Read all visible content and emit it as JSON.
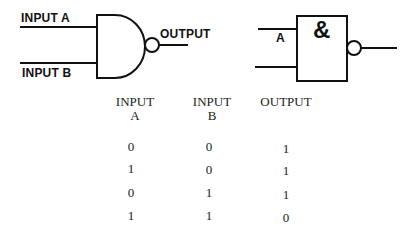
{
  "diagram": {
    "nand_gate_us": {
      "input_a_label": "INPUT A",
      "input_b_label": "INPUT B",
      "output_label": "OUTPUT"
    },
    "nand_gate_iec": {
      "symbol": "&",
      "input_label": "A"
    }
  },
  "truth_table": {
    "headers": [
      {
        "line1": "INPUT",
        "line2": "A"
      },
      {
        "line1": "INPUT",
        "line2": "B"
      },
      {
        "line1": "OUTPUT",
        "line2": ""
      }
    ],
    "rows": [
      [
        "0",
        "0",
        "1"
      ],
      [
        "1",
        "0",
        "1"
      ],
      [
        "0",
        "1",
        "1"
      ],
      [
        "1",
        "1",
        "0"
      ]
    ]
  }
}
